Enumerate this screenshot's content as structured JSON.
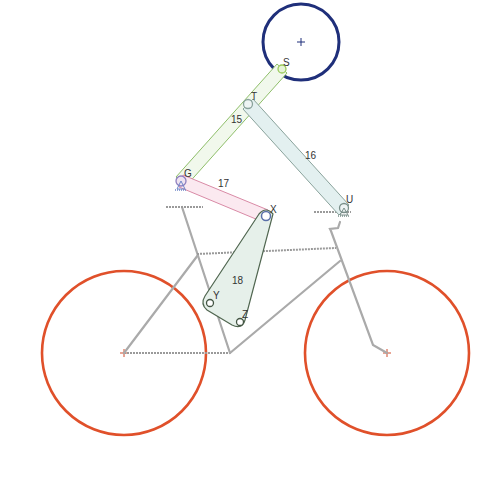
{
  "diagram": {
    "type": "linkage-mechanism",
    "colors": {
      "wheel": "#e0502a",
      "head": "#1f2f7a",
      "link15": "#8fbf6a",
      "link16": "#9ab8b0",
      "link17": "#d98aa6",
      "link18": "#506650",
      "frame": "#aaaaaa",
      "ground_joint": "#6f86c8"
    },
    "joints": [
      {
        "id": "S",
        "label": "S",
        "x": 282,
        "y": 69
      },
      {
        "id": "T",
        "label": "T",
        "x": 248,
        "y": 104
      },
      {
        "id": "G",
        "label": "G",
        "x": 181,
        "y": 181
      },
      {
        "id": "U",
        "label": "U",
        "x": 344,
        "y": 210
      },
      {
        "id": "X",
        "label": "X",
        "x": 266,
        "y": 216
      },
      {
        "id": "Y",
        "label": "Y",
        "x": 210,
        "y": 303
      },
      {
        "id": "Z",
        "label": "Z",
        "x": 240,
        "y": 322
      }
    ],
    "links": [
      {
        "id": "15",
        "label": "15",
        "from": "G",
        "to": "S"
      },
      {
        "id": "16",
        "label": "16",
        "from": "T",
        "to": "U"
      },
      {
        "id": "17",
        "label": "17",
        "from": "G",
        "to": "X"
      },
      {
        "id": "18",
        "label": "18",
        "vertices": [
          "X",
          "Y",
          "Z"
        ]
      }
    ],
    "bodies": {
      "head": {
        "cx": 301,
        "cy": 42,
        "r": 38
      },
      "rear_wheel": {
        "cx": 124,
        "cy": 353,
        "r": 82
      },
      "front_wheel": {
        "cx": 387,
        "cy": 353,
        "r": 82
      }
    },
    "ground_joints": [
      "G",
      "U"
    ]
  }
}
